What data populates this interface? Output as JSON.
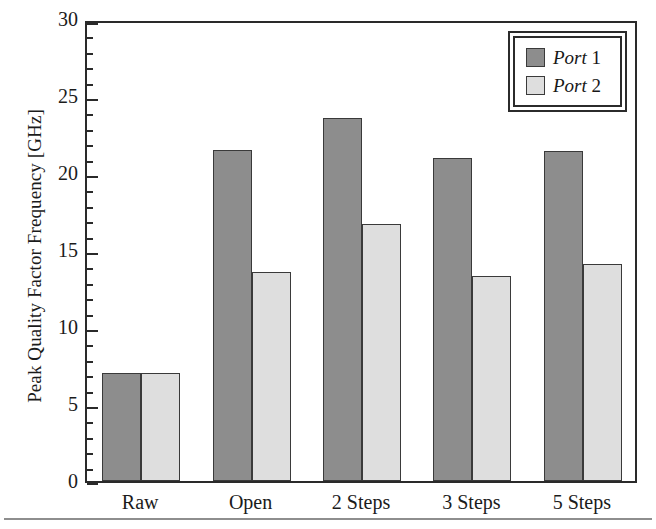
{
  "chart_data": {
    "type": "bar",
    "title": "",
    "xlabel": "",
    "ylabel": "Peak Quality Factor Frequency [GHz]",
    "ylim": [
      0,
      30
    ],
    "ytick_labels": [
      "0",
      "5",
      "10",
      "15",
      "20",
      "25",
      "30"
    ],
    "ytick_values": [
      0,
      5,
      10,
      15,
      20,
      25,
      30
    ],
    "yminor_step": 1,
    "grid": false,
    "legend_position": "top-right",
    "categories": [
      "Raw",
      "Open",
      "2 Steps",
      "3 Steps",
      "5 Steps"
    ],
    "series": [
      {
        "name": "Port 1",
        "color": "#8d8d8d",
        "values": [
          7.0,
          21.5,
          23.6,
          21.0,
          21.4
        ]
      },
      {
        "name": "Port 2",
        "color": "#dedede",
        "values": [
          7.0,
          13.6,
          16.7,
          13.3,
          14.1
        ]
      }
    ]
  },
  "legend": {
    "entries": [
      {
        "label_italic": "Port",
        "label_rest": "1"
      },
      {
        "label_italic": "Port",
        "label_rest": "2"
      }
    ]
  },
  "colors": {
    "port1": "#8d8d8d",
    "port2": "#dedede",
    "axis": "#2a2a2a",
    "bar_outline": "#3a3a3a",
    "text": "#1b1b1b",
    "page_rule": "#8e8e8e",
    "background": "#ffffff"
  }
}
